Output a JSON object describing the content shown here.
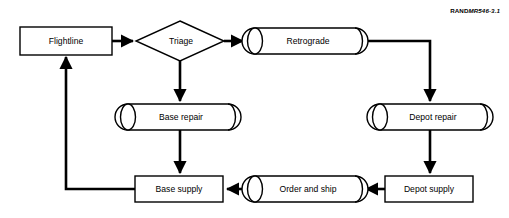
{
  "figure": {
    "credit_rand": "RAND",
    "credit_mr": "MR546-3.1",
    "background_color": "#ffffff",
    "line_color": "#000000"
  },
  "diagram": {
    "type": "flowchart",
    "nodes": [
      {
        "id": "flightline",
        "label": "Flightline",
        "shape": "rectangle",
        "cx": 66,
        "cy": 41,
        "w": 92,
        "h": 28
      },
      {
        "id": "triage",
        "label": "Triage",
        "shape": "diamond",
        "cx": 180,
        "cy": 41,
        "w": 88,
        "h": 40
      },
      {
        "id": "retrograde",
        "label": "Retrograde",
        "shape": "cylinder",
        "cx": 305,
        "cy": 41,
        "w": 118,
        "h": 26
      },
      {
        "id": "base-repair",
        "label": "Base repair",
        "shape": "cylinder",
        "cx": 178,
        "cy": 117,
        "w": 113,
        "h": 26
      },
      {
        "id": "depot-repair",
        "label": "Depot repair",
        "shape": "cylinder",
        "cx": 430,
        "cy": 117,
        "w": 113,
        "h": 26
      },
      {
        "id": "base-supply",
        "label": "Base supply",
        "shape": "rectangle",
        "cx": 179,
        "cy": 189,
        "w": 88,
        "h": 26
      },
      {
        "id": "order-ship",
        "label": "Order and ship",
        "shape": "cylinder",
        "cx": 305,
        "cy": 189,
        "w": 113,
        "h": 26
      },
      {
        "id": "depot-supply",
        "label": "Depot supply",
        "shape": "rectangle",
        "cx": 429,
        "cy": 189,
        "w": 88,
        "h": 26
      }
    ],
    "edges": [
      {
        "id": "flightline-to-triage",
        "from": "flightline",
        "to": "triage",
        "label": ""
      },
      {
        "id": "triage-to-retrograde",
        "from": "triage",
        "to": "retrograde",
        "label": ""
      },
      {
        "id": "triage-to-base-repair",
        "from": "triage",
        "to": "base-repair",
        "label": ""
      },
      {
        "id": "retrograde-to-depot-repair",
        "from": "retrograde",
        "to": "depot-repair",
        "label": ""
      },
      {
        "id": "base-repair-to-base-supply",
        "from": "base-repair",
        "to": "base-supply",
        "label": ""
      },
      {
        "id": "depot-repair-to-depot-supply",
        "from": "depot-repair",
        "to": "depot-supply",
        "label": ""
      },
      {
        "id": "depot-supply-to-order-ship",
        "from": "depot-supply",
        "to": "order-ship",
        "label": ""
      },
      {
        "id": "order-ship-to-base-supply",
        "from": "order-ship",
        "to": "base-supply",
        "label": ""
      },
      {
        "id": "base-supply-to-flightline",
        "from": "base-supply",
        "to": "flightline",
        "label": ""
      }
    ]
  }
}
